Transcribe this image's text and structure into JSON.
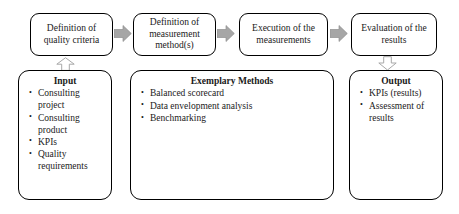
{
  "diagram": {
    "colors": {
      "box_border": "#000000",
      "box_fill": "#ffffff",
      "flow_arrow_fill": "#a6a6a6",
      "flow_arrow_stroke": "#8c8c8c",
      "vertical_arrow_fill": "#ffffff",
      "vertical_arrow_stroke": "#a6a6a6",
      "text": "#1a1a1a"
    },
    "stages": [
      {
        "id": "definition-quality-criteria",
        "label": "Definition of\nquality criteria"
      },
      {
        "id": "definition-measurement-method",
        "label": "Definition of\nmeasurement\nmethod(s)"
      },
      {
        "id": "execution-measurements",
        "label": "Execution of the\nmeasurements"
      },
      {
        "id": "evaluation-results",
        "label": "Evaluation of the\nresults"
      }
    ],
    "flow_arrows": [
      {
        "id": "arrow-stage1-to-stage2",
        "direction": "right"
      },
      {
        "id": "arrow-stage2-to-stage3",
        "direction": "right"
      },
      {
        "id": "arrow-stage3-to-stage4",
        "direction": "right"
      }
    ],
    "vertical_arrows": [
      {
        "id": "arrow-input-to-stage1",
        "direction": "up"
      },
      {
        "id": "arrow-stage4-to-output",
        "direction": "down"
      }
    ],
    "detail_boxes": [
      {
        "id": "input-box",
        "title": "Input",
        "items": [
          "Consulting project",
          "Consulting product",
          "KPIs",
          "Quality requirements"
        ]
      },
      {
        "id": "exemplary-methods-box",
        "title": "Exemplary Methods",
        "items": [
          "Balanced scorecard",
          "Data envelopment analysis",
          "Benchmarking"
        ]
      },
      {
        "id": "output-box",
        "title": "Output",
        "items": [
          "KPIs (results)",
          "Assessment of results"
        ]
      }
    ]
  }
}
